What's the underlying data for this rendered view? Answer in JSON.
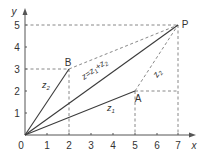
{
  "diagram": {
    "type": "vector-addition",
    "axes": {
      "x_label": "x",
      "y_label": "y",
      "origin_label": "0",
      "x_ticks": [
        "1",
        "2",
        "3",
        "4",
        "5",
        "6",
        "7"
      ],
      "y_ticks": [
        "1",
        "2",
        "3",
        "4",
        "5"
      ]
    },
    "points": {
      "A": {
        "label": "A",
        "x": 5,
        "y": 2
      },
      "B": {
        "label": "B",
        "x": 2,
        "y": 3
      },
      "P": {
        "label": "P",
        "x": 7,
        "y": 5
      }
    },
    "vectors": {
      "z1": {
        "base": "z",
        "sub": "1"
      },
      "z2_from_origin": {
        "base": "z",
        "sub": "2"
      },
      "z2_from_A": {
        "base": "z",
        "sub": "2"
      },
      "sum": {
        "text_a": "z=z",
        "sub_a": "1",
        "text_b": "+z",
        "sub_b": "2"
      }
    },
    "colors": {
      "solid": "#3a3a3a",
      "dashed": "#7a7a7a",
      "text": "#333333"
    }
  }
}
